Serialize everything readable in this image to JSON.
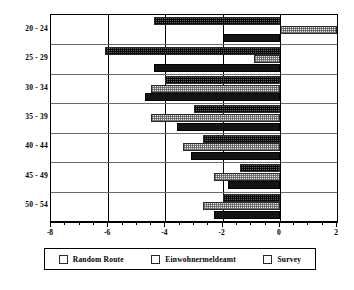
{
  "chart_data": {
    "type": "bar",
    "orientation": "horizontal",
    "title": "",
    "subtitle": "",
    "xlabel": "",
    "ylabel": "",
    "categories": [
      "20 - 24",
      "25 - 29",
      "30 - 34",
      "35 - 39",
      "40 - 44",
      "45 - 49",
      "50 - 54"
    ],
    "series": [
      {
        "name": "Random Route",
        "values": [
          -4.4,
          -6.1,
          -4.0,
          -3.0,
          -2.7,
          -1.4,
          -2.0
        ]
      },
      {
        "name": "Einwohnermeldeamt",
        "values": [
          2.0,
          -0.9,
          -4.5,
          -4.5,
          -3.4,
          -2.3,
          -2.7
        ]
      },
      {
        "name": "Survey",
        "values": [
          -2.0,
          -4.4,
          -4.7,
          -3.6,
          -3.1,
          -1.8,
          -2.3
        ]
      }
    ],
    "xlim": [
      -8,
      2
    ],
    "xticks": [
      -8,
      -6,
      -4,
      -2,
      0,
      2
    ],
    "xticklabels": [
      "-8",
      "-6",
      "-4",
      "-2",
      "0",
      "2"
    ],
    "minor_tick_step": 0.5,
    "grid": "vertical-major-and-horizontal-category",
    "legend_position": "bottom",
    "legend": [
      "Random Route",
      "Einwohnermeldeamt",
      "Survey"
    ],
    "series_colors": [
      "#5e5e5e",
      "#e2e2e2",
      "#141414"
    ]
  },
  "axes": {
    "x_tick_labels": [
      "-8",
      "-6",
      "-4",
      "-2",
      "0",
      "2"
    ],
    "y_tick_labels": [
      "20 - 24",
      "25 - 29",
      "30 - 34",
      "35 - 39",
      "40 - 44",
      "45 - 49",
      "50 - 54"
    ]
  },
  "legend": {
    "items": [
      {
        "label": "Random Route",
        "swatch": "dark-checker-swatch"
      },
      {
        "label": "Einwohnermeldeamt",
        "swatch": "light-checker-swatch"
      },
      {
        "label": "Survey",
        "swatch": "solid-black-swatch"
      }
    ]
  }
}
